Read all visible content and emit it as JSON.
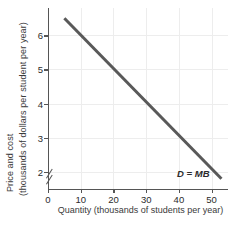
{
  "chart_data": {
    "type": "line",
    "title": "",
    "xlabel": "Quantity (thousands of students per year)",
    "ylabel_line1": "Price and cost",
    "ylabel_line2": "(thousands of dollars per student per year)",
    "xlim": [
      0,
      55
    ],
    "ylim": [
      1.5,
      6.8
    ],
    "y_axis_break": true,
    "grid": true,
    "legend": "none",
    "xticks": [
      0,
      10,
      20,
      30,
      40,
      50
    ],
    "xtick_labels": [
      "0",
      "10",
      "20",
      "30",
      "40",
      "50"
    ],
    "yticks": [
      2,
      3,
      4,
      5,
      6
    ],
    "ytick_labels": [
      "2",
      "3",
      "4",
      "5",
      "6"
    ],
    "series": [
      {
        "name": "D = MB",
        "label": "D = MB",
        "label_x": 48,
        "label_y": 1.95,
        "color": "#595959",
        "linewidth": 3,
        "x": [
          5,
          53
        ],
        "y": [
          6.5,
          1.8
        ],
        "slope": -0.0979,
        "intercept": 6.99
      }
    ],
    "annotations": [
      {
        "text": "D = MB",
        "x": 48,
        "y": 1.95,
        "style": "bold-italic"
      }
    ]
  },
  "colors": {
    "curve": "#595959",
    "axis": "#555555",
    "grid": "#ededed",
    "text": "#2b2b2b",
    "background": "#ffffff"
  }
}
